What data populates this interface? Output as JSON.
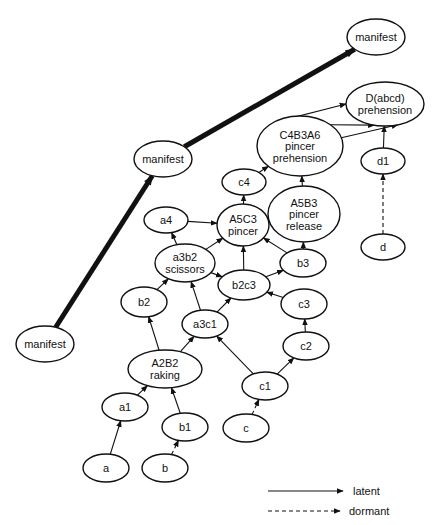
{
  "diagram": {
    "nodes": [
      {
        "id": "manifest_top",
        "label": [
          "manifest"
        ],
        "cx": 376,
        "cy": 37,
        "rx": 29,
        "ry": 18
      },
      {
        "id": "Dabcd",
        "label": [
          "D(abcd)",
          "prehension"
        ],
        "cx": 385,
        "cy": 104,
        "rx": 39,
        "ry": 22
      },
      {
        "id": "C4B3A6",
        "label": [
          "C4B3A6",
          "pincer",
          "prehension"
        ],
        "cx": 300,
        "cy": 146,
        "rx": 43,
        "ry": 30
      },
      {
        "id": "manifest_mid",
        "label": [
          "manifest"
        ],
        "cx": 163,
        "cy": 159,
        "rx": 29,
        "ry": 18
      },
      {
        "id": "c4",
        "label": [
          "c4"
        ],
        "cx": 244,
        "cy": 182,
        "rx": 22,
        "ry": 13
      },
      {
        "id": "d1",
        "label": [
          "d1"
        ],
        "cx": 383,
        "cy": 161,
        "rx": 22,
        "ry": 13
      },
      {
        "id": "A5B3",
        "label": [
          "A5B3",
          "pincer",
          "release"
        ],
        "cx": 304,
        "cy": 214,
        "rx": 36,
        "ry": 28
      },
      {
        "id": "a4",
        "label": [
          "a4"
        ],
        "cx": 166,
        "cy": 220,
        "rx": 22,
        "ry": 13
      },
      {
        "id": "A5C3",
        "label": [
          "A5C3",
          "pincer"
        ],
        "cx": 243,
        "cy": 225,
        "rx": 26,
        "ry": 21
      },
      {
        "id": "d",
        "label": [
          "d"
        ],
        "cx": 383,
        "cy": 247,
        "rx": 22,
        "ry": 13
      },
      {
        "id": "a3b2",
        "label": [
          "a3b2",
          "scissors"
        ],
        "cx": 185,
        "cy": 263,
        "rx": 30,
        "ry": 19
      },
      {
        "id": "b3",
        "label": [
          "b3"
        ],
        "cx": 303,
        "cy": 263,
        "rx": 23,
        "ry": 14
      },
      {
        "id": "b2c3",
        "label": [
          "b2c3"
        ],
        "cx": 244,
        "cy": 285,
        "rx": 26,
        "ry": 15
      },
      {
        "id": "b2",
        "label": [
          "b2"
        ],
        "cx": 144,
        "cy": 302,
        "rx": 23,
        "ry": 15
      },
      {
        "id": "c3",
        "label": [
          "c3"
        ],
        "cx": 304,
        "cy": 304,
        "rx": 23,
        "ry": 15
      },
      {
        "id": "a3c1",
        "label": [
          "a3c1"
        ],
        "cx": 205,
        "cy": 324,
        "rx": 23,
        "ry": 14
      },
      {
        "id": "manifest_left",
        "label": [
          "manifest"
        ],
        "cx": 45,
        "cy": 344,
        "rx": 29,
        "ry": 18
      },
      {
        "id": "c2",
        "label": [
          "c2"
        ],
        "cx": 306,
        "cy": 346,
        "rx": 23,
        "ry": 14
      },
      {
        "id": "A2B2",
        "label": [
          "A2B2",
          "raking"
        ],
        "cx": 165,
        "cy": 369,
        "rx": 37,
        "ry": 19
      },
      {
        "id": "c1",
        "label": [
          "c1"
        ],
        "cx": 265,
        "cy": 386,
        "rx": 23,
        "ry": 14
      },
      {
        "id": "a1",
        "label": [
          "a1"
        ],
        "cx": 125,
        "cy": 407,
        "rx": 23,
        "ry": 14
      },
      {
        "id": "b1",
        "label": [
          "b1"
        ],
        "cx": 185,
        "cy": 427,
        "rx": 23,
        "ry": 14
      },
      {
        "id": "c",
        "label": [
          "c"
        ],
        "cx": 246,
        "cy": 428,
        "rx": 23,
        "ry": 14
      },
      {
        "id": "a",
        "label": [
          "a"
        ],
        "cx": 106,
        "cy": 468,
        "rx": 23,
        "ry": 14
      },
      {
        "id": "b",
        "label": [
          "b"
        ],
        "cx": 165,
        "cy": 468,
        "rx": 23,
        "ry": 14
      }
    ],
    "edges": [
      {
        "from": "a",
        "to": "a1",
        "type": "latent"
      },
      {
        "from": "b",
        "to": "b1",
        "type": "dormant"
      },
      {
        "from": "c",
        "to": "c1",
        "type": "dormant"
      },
      {
        "from": "d",
        "to": "d1",
        "type": "dormant"
      },
      {
        "from": "a1",
        "to": "A2B2",
        "type": "latent"
      },
      {
        "from": "b1",
        "to": "A2B2",
        "type": "latent"
      },
      {
        "from": "A2B2",
        "to": "b2",
        "type": "latent"
      },
      {
        "from": "A2B2",
        "to": "a3c1",
        "type": "latent"
      },
      {
        "from": "c1",
        "to": "a3c1",
        "type": "latent"
      },
      {
        "from": "c1",
        "to": "c2",
        "type": "latent"
      },
      {
        "from": "c2",
        "to": "c3",
        "type": "latent"
      },
      {
        "from": "b2",
        "to": "a3b2",
        "type": "latent"
      },
      {
        "from": "a3c1",
        "to": "a3b2",
        "type": "latent"
      },
      {
        "from": "a3c1",
        "to": "b2c3",
        "type": "latent"
      },
      {
        "from": "c3",
        "to": "b2c3",
        "type": "latent"
      },
      {
        "from": "a3b2",
        "to": "b2c3",
        "type": "latent"
      },
      {
        "from": "b2c3",
        "to": "b3",
        "type": "latent"
      },
      {
        "from": "b2c3",
        "to": "A5C3",
        "type": "latent"
      },
      {
        "from": "a3b2",
        "to": "a4",
        "type": "latent"
      },
      {
        "from": "a3b2",
        "to": "A5C3",
        "type": "latent"
      },
      {
        "from": "b3",
        "to": "A5C3",
        "type": "latent"
      },
      {
        "from": "b3",
        "to": "A5B3",
        "type": "latent"
      },
      {
        "from": "a4",
        "to": "A5C3",
        "type": "latent"
      },
      {
        "from": "A5C3",
        "to": "c4",
        "type": "latent"
      },
      {
        "from": "A5C3",
        "to": "A5B3",
        "type": "latent"
      },
      {
        "from": "A5B3",
        "to": "C4B3A6",
        "type": "latent"
      },
      {
        "from": "c4",
        "to": "C4B3A6",
        "type": "latent"
      },
      {
        "from": "C4B3A6",
        "to": "Dabcd",
        "type": "latent",
        "variant": "top"
      },
      {
        "from": "C4B3A6",
        "to": "Dabcd",
        "type": "latent",
        "variant": "mid"
      },
      {
        "from": "C4B3A6",
        "to": "Dabcd",
        "type": "latent",
        "variant": "low"
      },
      {
        "from": "d1",
        "to": "Dabcd",
        "type": "latent"
      },
      {
        "from": "manifest_left",
        "to": "manifest_mid",
        "type": "manifest"
      },
      {
        "from": "manifest_mid",
        "to": "manifest_top",
        "type": "manifest"
      }
    ]
  },
  "legend": {
    "latent_label": "latent",
    "dormant_label": "dormant"
  }
}
